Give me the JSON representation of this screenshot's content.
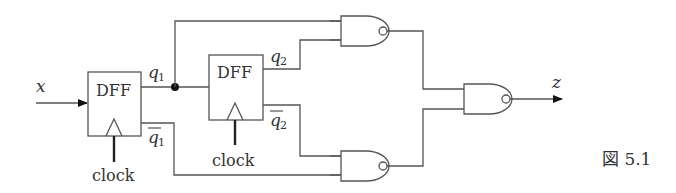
{
  "figure": {
    "caption": "図 5.1"
  },
  "signals": {
    "input": "x",
    "output": "z",
    "q1": {
      "base": "q",
      "sub": "1"
    },
    "q1_bar": {
      "base": "q",
      "sub": "1"
    },
    "q2": {
      "base": "q",
      "sub": "2"
    },
    "q2_bar": {
      "base": "q",
      "sub": "2"
    }
  },
  "components": {
    "dff1": {
      "label": "DFF",
      "clock_label": "clock"
    },
    "dff2": {
      "label": "DFF",
      "clock_label": "clock"
    },
    "nand_top": {
      "type": "NAND",
      "inputs": [
        "q1",
        "q2"
      ]
    },
    "nand_bottom": {
      "type": "NAND",
      "inputs": [
        "q2_bar",
        "q1_bar"
      ]
    },
    "nand_out": {
      "type": "NAND",
      "inputs": [
        "nand_top",
        "nand_bottom"
      ],
      "output": "z"
    }
  }
}
